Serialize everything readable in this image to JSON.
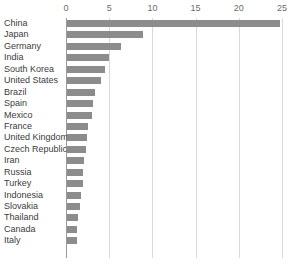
{
  "chart_data": {
    "type": "bar",
    "orientation": "horizontal",
    "title": "",
    "subtitle": "",
    "xlabel": "",
    "ylabel": "",
    "xlim": [
      0,
      25
    ],
    "ylim": null,
    "grid": true,
    "legend": null,
    "legend_position": "none",
    "xticks": [
      0,
      5,
      10,
      15,
      20,
      25
    ],
    "xtick_labels": [
      "0",
      "5",
      "10",
      "15",
      "20",
      "25"
    ],
    "categories": [
      "China",
      "Japan",
      "Germany",
      "India",
      "South Korea",
      "United States",
      "Brazil",
      "Spain",
      "Mexico",
      "France",
      "United Kingdom",
      "Czech Republic",
      "Iran",
      "Russia",
      "Turkey",
      "Indonesia",
      "Slovakia",
      "Thailand",
      "Canada",
      "Italy"
    ],
    "values": [
      24.7,
      8.8,
      6.3,
      4.9,
      4.4,
      3.9,
      3.2,
      3.0,
      2.9,
      2.4,
      2.3,
      2.2,
      2.0,
      1.9,
      1.8,
      1.6,
      1.5,
      1.3,
      1.2,
      1.2
    ],
    "bar_color": "#8c8c8c",
    "gridline_color": "#d9d9d9",
    "axis_color": "#9a9a9a",
    "label_color": "#3c3c3c",
    "tick_label_color": "#6b6b6b"
  }
}
